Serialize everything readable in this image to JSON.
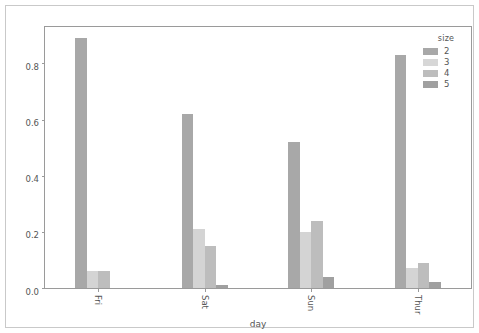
{
  "chart_data": {
    "type": "bar",
    "title": "",
    "subtitle": "",
    "xlabel": "day",
    "ylabel": "",
    "categories": [
      "Fri",
      "Sat",
      "Sun",
      "Thur"
    ],
    "series": [
      {
        "name": "2",
        "values": [
          0.89,
          0.62,
          0.52,
          0.83
        ],
        "color": "#a8a8a8"
      },
      {
        "name": "3",
        "values": [
          0.06,
          0.21,
          0.2,
          0.07
        ],
        "color": "#d4d4d4"
      },
      {
        "name": "4",
        "values": [
          0.06,
          0.15,
          0.24,
          0.09
        ],
        "color": "#bdbdbd"
      },
      {
        "name": "5",
        "values": [
          null,
          0.01,
          0.04,
          0.02
        ],
        "color": "#a0a0a0"
      }
    ],
    "ylim": [
      0.0,
      0.93
    ],
    "yticks": [
      0.0,
      0.2,
      0.4,
      0.6,
      0.8
    ],
    "ytick_labels": [
      "0.0",
      "0.2",
      "0.4",
      "0.6",
      "0.8"
    ],
    "grid": false,
    "legend": {
      "title": "size",
      "position": "upper right",
      "entries": [
        {
          "label": "2",
          "color": "#a8a8a8"
        },
        {
          "label": "3",
          "color": "#d7d7d7"
        },
        {
          "label": "4",
          "color": "#bdbdbd"
        },
        {
          "label": "5",
          "color": "#a0a0a0"
        }
      ]
    },
    "axis_color": "#9a9a9a",
    "text_color": "#555555",
    "background": "#ffffff"
  }
}
